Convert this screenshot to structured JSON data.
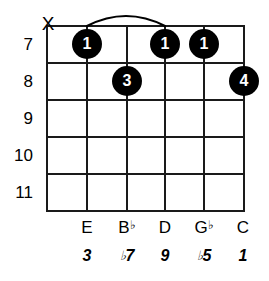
{
  "diagram": {
    "type": "guitar-chord-diagram",
    "muted_strings": [
      "1"
    ],
    "fret_numbers": [
      "7",
      "8",
      "9",
      "10",
      "11"
    ],
    "strings": [
      {
        "index": 1,
        "note": "",
        "accidental": "",
        "interval": "",
        "interval_accidental": "",
        "muted": true
      },
      {
        "index": 2,
        "note": "E",
        "accidental": "",
        "interval": "3",
        "interval_accidental": ""
      },
      {
        "index": 3,
        "note": "B",
        "accidental": "♭",
        "interval": "7",
        "interval_accidental": "♭"
      },
      {
        "index": 4,
        "note": "D",
        "accidental": "",
        "interval": "9",
        "interval_accidental": ""
      },
      {
        "index": 5,
        "note": "G",
        "accidental": "♭",
        "interval": "5",
        "interval_accidental": "♭"
      },
      {
        "index": 6,
        "note": "C",
        "accidental": "",
        "interval": "1",
        "interval_accidental": ""
      }
    ],
    "dots": [
      {
        "string": 2,
        "fret": "7",
        "finger": "1"
      },
      {
        "string": 4,
        "fret": "7",
        "finger": "1"
      },
      {
        "string": 5,
        "fret": "7",
        "finger": "1"
      },
      {
        "string": 3,
        "fret": "8",
        "finger": "3"
      },
      {
        "string": 6,
        "fret": "8",
        "finger": "4"
      }
    ],
    "barre": {
      "from_string": 2,
      "to_string": 4,
      "fret": "7",
      "finger": "1"
    },
    "mute_symbol": "X",
    "colors": {
      "grid": "#1a1a1a",
      "dot": "#000000",
      "dot_text": "#ffffff",
      "background": "#ffffff"
    }
  }
}
